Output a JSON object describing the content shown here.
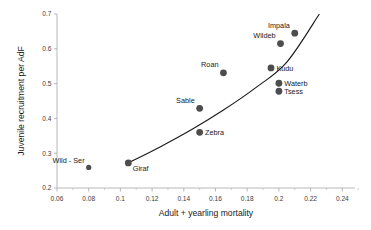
{
  "chart_data": {
    "type": "scatter",
    "title": "",
    "xlabel": "Adult + yearling mortality",
    "ylabel": "Juvenile recruitment per AdF",
    "xlim": [
      0.06,
      0.248
    ],
    "ylim": [
      0.2,
      0.7
    ],
    "xticks": [
      "0.06",
      "0.08",
      "0.1",
      "0.12",
      "0.14",
      "0.16",
      "0.18",
      "0.2",
      "0.22",
      "0.24"
    ],
    "xtick_values": [
      0.06,
      0.08,
      0.1,
      0.12,
      0.14,
      0.16,
      0.18,
      0.2,
      0.22,
      0.24
    ],
    "yticks": [
      "0.2",
      "0.3",
      "0.4",
      "0.5",
      "0.6",
      "0.7"
    ],
    "ytick_values": [
      0.2,
      0.3,
      0.4,
      0.5,
      0.6,
      0.7
    ],
    "grid": false,
    "legend": "none",
    "points": [
      {
        "label": "Wild - Ser",
        "x": 0.08,
        "y": 0.259,
        "label_pos": "above-left",
        "marker_size": 2.6
      },
      {
        "label": "Giraf",
        "x": 0.105,
        "y": 0.272,
        "label_pos": "below-right",
        "marker_size": 3.4
      },
      {
        "label": "Zebra",
        "x": 0.15,
        "y": 0.36,
        "label_pos": "right",
        "marker_size": 3.4
      },
      {
        "label": "Sable",
        "x": 0.15,
        "y": 0.429,
        "label_pos": "above-left",
        "marker_size": 3.4
      },
      {
        "label": "Roan",
        "x": 0.165,
        "y": 0.531,
        "label_pos": "above-left",
        "marker_size": 3.4
      },
      {
        "label": "Tsess",
        "x": 0.2,
        "y": 0.478,
        "label_pos": "right",
        "marker_size": 3.4
      },
      {
        "label": "Waterb",
        "x": 0.2,
        "y": 0.501,
        "label_pos": "right",
        "marker_size": 3.4
      },
      {
        "label": "Kudu",
        "x": 0.195,
        "y": 0.545,
        "label_pos": "right",
        "marker_size": 3.4
      },
      {
        "label": "Wildeb",
        "x": 0.201,
        "y": 0.615,
        "label_pos": "above-left",
        "marker_size": 3.4
      },
      {
        "label": "Impala",
        "x": 0.21,
        "y": 0.645,
        "label_pos": "above-left",
        "marker_size": 3.4
      }
    ],
    "trend_line": {
      "description": "fitted increasing curve",
      "points": [
        {
          "x": 0.105,
          "y": 0.272
        },
        {
          "x": 0.125,
          "y": 0.318
        },
        {
          "x": 0.145,
          "y": 0.368
        },
        {
          "x": 0.165,
          "y": 0.424
        },
        {
          "x": 0.185,
          "y": 0.487
        },
        {
          "x": 0.205,
          "y": 0.562
        },
        {
          "x": 0.2255,
          "y": 0.7
        }
      ]
    },
    "colors": {
      "marker": "#4d4d4d",
      "curve": "#1a1a1a",
      "axis": "#a6a6a6",
      "text": "#1a1a1a",
      "background": "#ffffff"
    }
  }
}
